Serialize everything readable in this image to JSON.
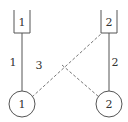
{
  "diagram": {
    "colors": {
      "stroke": "#555555",
      "dashed": "#777777",
      "text": "#333333",
      "background": "#ffffff"
    },
    "slots": [
      {
        "label": "1"
      },
      {
        "label": "2"
      }
    ],
    "nodes": [
      {
        "label": "1"
      },
      {
        "label": "2"
      }
    ],
    "edges": [
      {
        "from": "node-1",
        "to": "slot-1",
        "label": "1",
        "style": "solid"
      },
      {
        "from": "node-2",
        "to": "slot-2",
        "label": "2",
        "style": "solid"
      },
      {
        "from": "node-1",
        "to": "slot-2",
        "label": "3",
        "style": "dashed"
      },
      {
        "from": "crossing",
        "to": "node-2",
        "label": "",
        "style": "dashed"
      }
    ]
  }
}
